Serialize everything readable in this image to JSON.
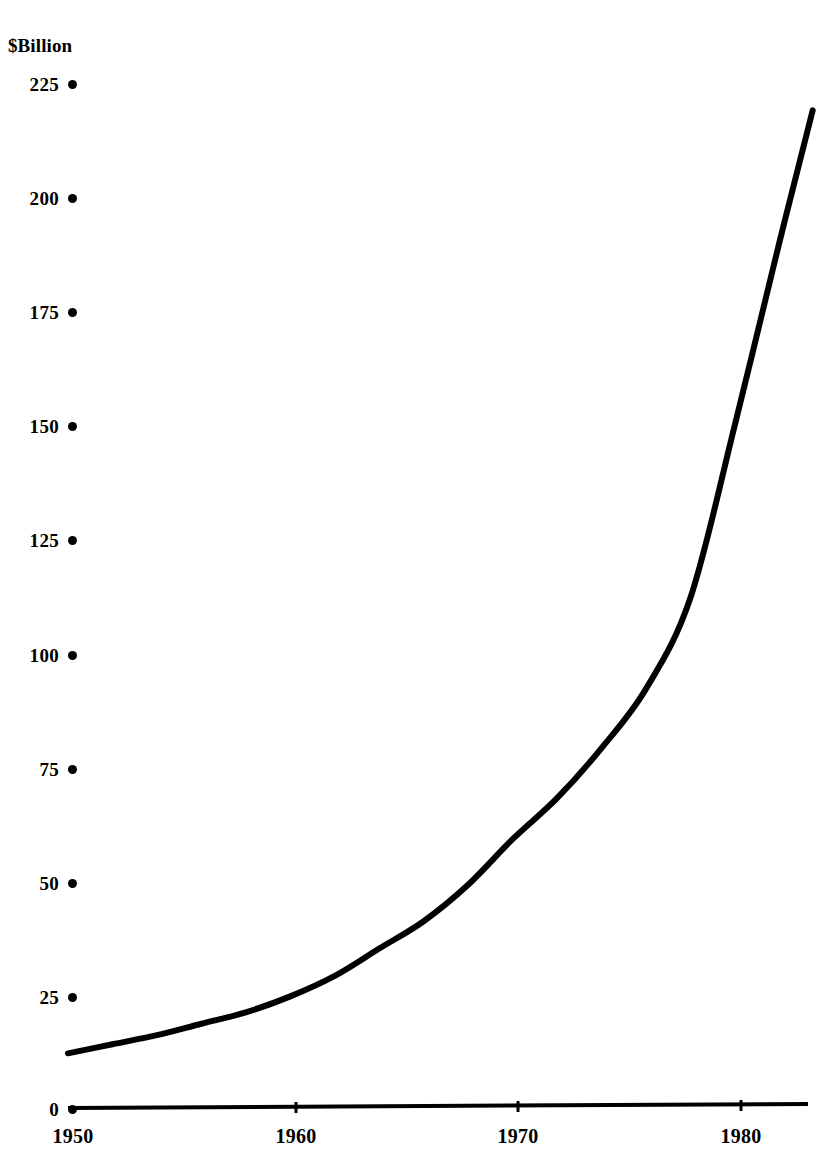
{
  "chart_data": {
    "type": "line",
    "title": "",
    "subtitle": "",
    "xlabel": "",
    "ylabel": "$Billion",
    "unit_label": "$Billion",
    "xlim": [
      1950,
      1984
    ],
    "ylim": [
      0,
      225
    ],
    "grid": false,
    "legend": null,
    "x_ticks": [
      1950,
      1960,
      1970,
      1980
    ],
    "x_tick_labels": [
      "1950",
      "1960",
      "1970",
      "1980"
    ],
    "y_ticks": [
      0,
      25,
      50,
      75,
      100,
      125,
      150,
      175,
      200,
      225
    ],
    "y_tick_labels": [
      "0",
      "25",
      "50",
      "75",
      "100",
      "125",
      "150",
      "175",
      "200",
      "225"
    ],
    "y_tick_marker": "bullet-dot",
    "line_color": "#000000",
    "line_width_px": 6,
    "series": [
      {
        "name": "value",
        "x": [
          1950,
          1952,
          1954,
          1956,
          1958,
          1960,
          1962,
          1964,
          1966,
          1968,
          1970,
          1972,
          1974,
          1976,
          1978,
          1980,
          1982,
          1983.5
        ],
        "values": [
          12,
          14,
          16,
          18.5,
          21,
          24.5,
          29,
          35,
          41,
          49,
          59,
          68,
          79,
          92,
          112,
          150,
          190,
          219
        ]
      }
    ]
  },
  "axes": {
    "y": {
      "unit_label": "$Billion",
      "ticks": [
        {
          "label": "225",
          "value": 225
        },
        {
          "label": "200",
          "value": 200
        },
        {
          "label": "175",
          "value": 175
        },
        {
          "label": "150",
          "value": 150
        },
        {
          "label": "125",
          "value": 125
        },
        {
          "label": "100",
          "value": 100
        },
        {
          "label": "75",
          "value": 75
        },
        {
          "label": "50",
          "value": 50
        },
        {
          "label": "25",
          "value": 25
        },
        {
          "label": "0",
          "value": 0
        }
      ]
    },
    "x": {
      "ticks": [
        {
          "label": "1950",
          "value": 1950
        },
        {
          "label": "1960",
          "value": 1960
        },
        {
          "label": "1970",
          "value": 1970
        },
        {
          "label": "1980",
          "value": 1980
        }
      ]
    }
  }
}
